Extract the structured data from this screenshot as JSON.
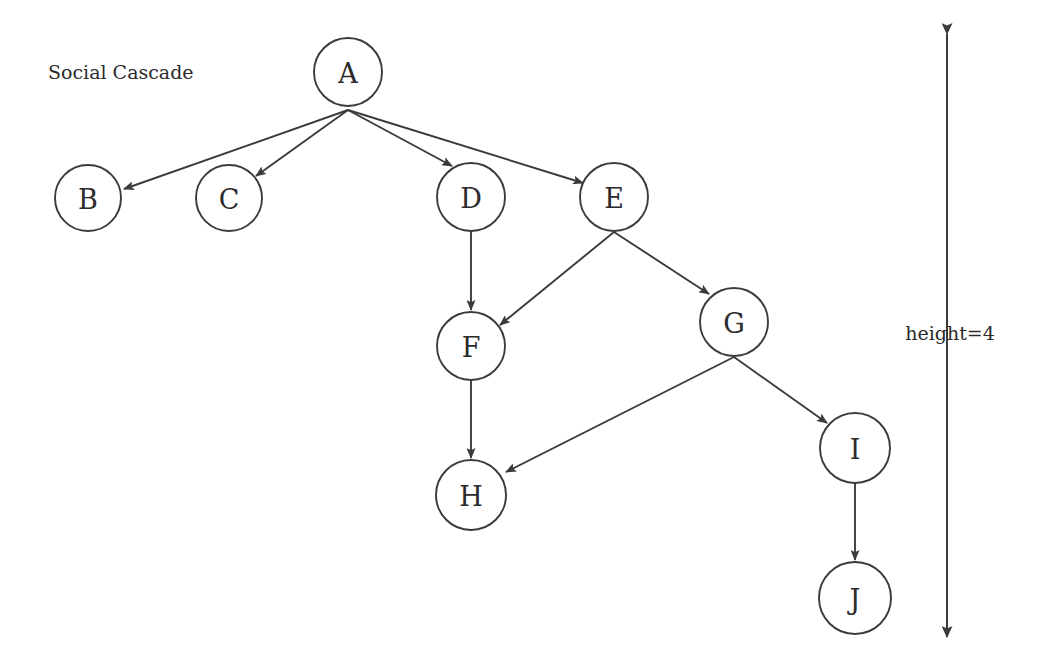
{
  "figure": {
    "title": "Social Cascade",
    "title_position": {
      "x": 48,
      "y": 72
    },
    "background_color": "#ffffff",
    "stroke_color": "#3b3b3b",
    "text_color": "#2b2b2b",
    "width": 1039,
    "height": 666
  },
  "annotation": {
    "height_label": "height=4",
    "label_position": {
      "x": 950,
      "y": 333
    },
    "axis": {
      "x": 947,
      "top_y": 34,
      "bottom_y": 637,
      "arrowheads": "both"
    }
  },
  "graph": {
    "type": "directed-tree",
    "node_radius": 34,
    "nodes": [
      {
        "id": "A",
        "label": "A",
        "cx": 348,
        "cy": 72,
        "r": 34,
        "depth": 0
      },
      {
        "id": "B",
        "label": "B",
        "cx": 88,
        "cy": 198,
        "r": 33,
        "depth": 1
      },
      {
        "id": "C",
        "label": "C",
        "cx": 229,
        "cy": 198,
        "r": 33,
        "depth": 1
      },
      {
        "id": "D",
        "label": "D",
        "cx": 471,
        "cy": 197,
        "r": 34,
        "depth": 1
      },
      {
        "id": "E",
        "label": "E",
        "cx": 614,
        "cy": 197,
        "r": 34,
        "depth": 1
      },
      {
        "id": "F",
        "label": "F",
        "cx": 471,
        "cy": 346,
        "r": 34,
        "depth": 2
      },
      {
        "id": "G",
        "label": "G",
        "cx": 734,
        "cy": 322,
        "r": 34,
        "depth": 2
      },
      {
        "id": "H",
        "label": "H",
        "cx": 471,
        "cy": 495,
        "r": 35,
        "depth": 3
      },
      {
        "id": "I",
        "label": "I",
        "cx": 855,
        "cy": 448,
        "r": 35,
        "depth": 3
      },
      {
        "id": "J",
        "label": "J",
        "cx": 855,
        "cy": 598,
        "r": 36,
        "depth": 4
      }
    ],
    "edges": [
      {
        "from": "A",
        "to": "B",
        "x1": 348,
        "y1": 110,
        "x2": 124,
        "y2": 189
      },
      {
        "from": "A",
        "to": "C",
        "x1": 348,
        "y1": 110,
        "x2": 256,
        "y2": 176
      },
      {
        "from": "A",
        "to": "D",
        "x1": 348,
        "y1": 110,
        "x2": 452,
        "y2": 166
      },
      {
        "from": "A",
        "to": "E",
        "x1": 348,
        "y1": 110,
        "x2": 583,
        "y2": 183
      },
      {
        "from": "D",
        "to": "F",
        "x1": 471,
        "y1": 231,
        "x2": 471,
        "y2": 310
      },
      {
        "from": "E",
        "to": "F",
        "x1": 614,
        "y1": 232,
        "x2": 500,
        "y2": 325
      },
      {
        "from": "E",
        "to": "G",
        "x1": 614,
        "y1": 232,
        "x2": 709,
        "y2": 294
      },
      {
        "from": "F",
        "to": "H",
        "x1": 471,
        "y1": 380,
        "x2": 471,
        "y2": 458
      },
      {
        "from": "G",
        "to": "H",
        "x1": 734,
        "y1": 357,
        "x2": 506,
        "y2": 472
      },
      {
        "from": "G",
        "to": "I",
        "x1": 734,
        "y1": 357,
        "x2": 827,
        "y2": 423
      },
      {
        "from": "I",
        "to": "J",
        "x1": 855,
        "y1": 483,
        "x2": 855,
        "y2": 560
      }
    ]
  }
}
